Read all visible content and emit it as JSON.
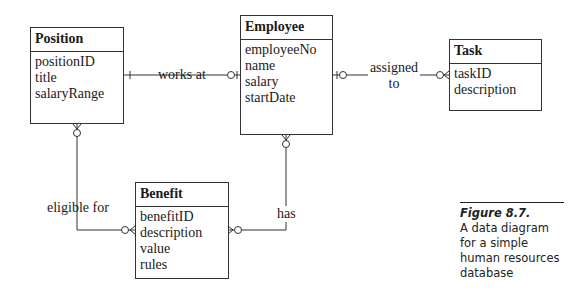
{
  "entities": {
    "position": {
      "title": "Position",
      "attributes": [
        "positionID",
        "title",
        "salaryRange"
      ]
    },
    "employee": {
      "title": "Employee",
      "attributes": [
        "employeeNo",
        "name",
        "salary",
        "startDate"
      ]
    },
    "task": {
      "title": "Task",
      "attributes": [
        "taskID",
        "description"
      ]
    },
    "benefit": {
      "title": "Benefit",
      "attributes": [
        "benefitID",
        "description",
        "value",
        "rules"
      ]
    }
  },
  "relationships": {
    "works_at": {
      "label": "works at",
      "from": "Position",
      "to": "Employee"
    },
    "assigned_to": {
      "label_line1": "assigned",
      "label_line2": "to",
      "from": "Employee",
      "to": "Task"
    },
    "eligible_for": {
      "label": "eligible for",
      "from": "Position",
      "to": "Benefit"
    },
    "has": {
      "label": "has",
      "from": "Employee",
      "to": "Benefit"
    }
  },
  "caption": {
    "figure": "Figure 8.7.",
    "text_lines": [
      "A data diagram",
      "for a simple",
      "human resources",
      "database"
    ]
  }
}
